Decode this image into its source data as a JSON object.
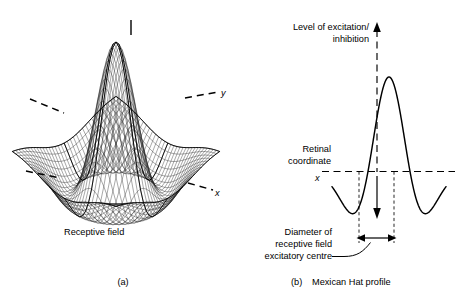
{
  "figure": {
    "background_color": "#ffffff",
    "ink_color": "#000000"
  },
  "panel_a": {
    "caption": "(a)",
    "surface_label": "Receptive field",
    "axis_x_label": "x",
    "axis_y_label": "y",
    "description": "Three-dimensional wireframe mesh of a difference-of-Gaussians (Mexican Hat) receptive field surface with a tall central excitatory peak surrounded by an inhibitory trough."
  },
  "panel_b": {
    "caption_prefix": "(b)",
    "caption_text": "Mexican Hat profile",
    "vertical_axis_label_line1": "Level of excitation/",
    "vertical_axis_label_line2": "inhibition",
    "horizontal_axis_label_line1": "Retinal",
    "horizontal_axis_label_line2": "coordinate",
    "horizontal_axis_symbol": "x",
    "annotation_line1": "Diameter of",
    "annotation_line2": "receptive field",
    "annotation_line3": "excitatory centre"
  },
  "chart_data": [
    {
      "type": "line",
      "name": "Mexican Hat profile (panel b)",
      "title": "Mexican Hat profile",
      "xlabel": "Retinal coordinate x",
      "ylabel": "Level of excitation/inhibition",
      "function": "difference-of-Gaussians (Ricker wavelet)",
      "grid": false,
      "legend": false,
      "xlim": [
        -3.2,
        3.2
      ],
      "ylim": [
        -0.25,
        1.05
      ],
      "x": [
        -3.2,
        -3.0,
        -2.8,
        -2.6,
        -2.4,
        -2.2,
        -2.0,
        -1.8,
        -1.6,
        -1.4,
        -1.2,
        -1.0,
        -0.8,
        -0.6,
        -0.4,
        -0.2,
        0.0,
        0.2,
        0.4,
        0.6,
        0.8,
        1.0,
        1.2,
        1.4,
        1.6,
        1.8,
        2.0,
        2.2,
        2.4,
        2.6,
        2.8,
        3.0,
        3.2
      ],
      "y": [
        -0.02,
        -0.04,
        -0.08,
        -0.13,
        -0.17,
        -0.2,
        -0.21,
        -0.2,
        -0.16,
        -0.09,
        0.03,
        0.21,
        0.45,
        0.69,
        0.88,
        0.98,
        1.0,
        0.98,
        0.88,
        0.69,
        0.45,
        0.21,
        0.03,
        -0.09,
        -0.16,
        -0.2,
        -0.21,
        -0.2,
        -0.17,
        -0.13,
        -0.08,
        -0.04,
        -0.02
      ],
      "features": {
        "peak_value": 1.0,
        "peak_x": 0.0,
        "zero_crossings_x": [
          -1.18,
          1.18
        ],
        "trough_value": -0.21,
        "trough_x": [
          -2.0,
          2.0
        ],
        "excitatory_centre_diameter_x": [
          -1.18,
          1.18
        ]
      },
      "annotations": [
        "Level of excitation/ inhibition",
        "Retinal coordinate x",
        "Diameter of receptive field excitatory centre"
      ]
    },
    {
      "type": "heatmap",
      "name": "Receptive field surface (panel a)",
      "title": "Receptive field",
      "xlabel": "x",
      "ylabel": "y",
      "zlabel": "Level of excitation/inhibition",
      "function": "difference-of-Gaussians (Mexican Hat) surface, z = (1 - r^2/s^2) * exp(-r^2/(2 s^2))",
      "grid": true,
      "legend": false,
      "xlim": [
        -3.4,
        3.4
      ],
      "ylim": [
        -3.4,
        3.4
      ],
      "zlim": [
        -0.25,
        1.0
      ],
      "peak_value": 1.0,
      "trough_value": -0.21,
      "mesh_divisions": 34
    }
  ]
}
